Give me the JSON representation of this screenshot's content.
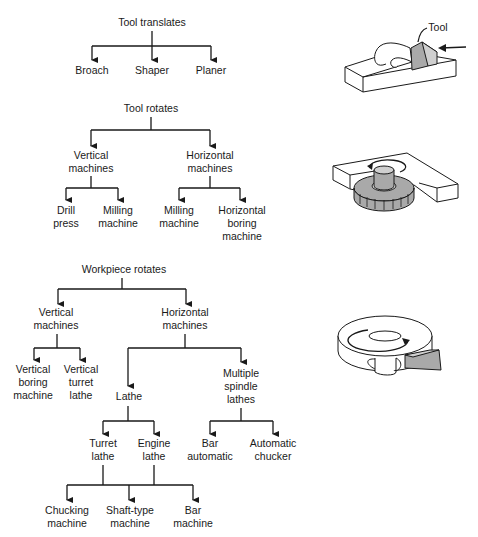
{
  "trees": {
    "tool_translates": {
      "root": "Tool translates",
      "children": [
        "Broach",
        "Shaper",
        "Planer"
      ]
    },
    "tool_rotates": {
      "root": "Tool rotates",
      "vertical": {
        "label": [
          "Vertical",
          "machines"
        ],
        "children": [
          [
            "Drill",
            "press"
          ],
          [
            "Milling",
            "machine"
          ]
        ]
      },
      "horizontal": {
        "label": [
          "Horizontal",
          "machines"
        ],
        "children": [
          [
            "Milling",
            "machine"
          ],
          [
            "Horizontal",
            "boring",
            "machine"
          ]
        ]
      }
    },
    "workpiece_rotates": {
      "root": "Workpiece rotates",
      "vertical": {
        "label": [
          "Vertical",
          "machines"
        ],
        "children": [
          [
            "Vertical",
            "boring",
            "machine"
          ],
          [
            "Vertical",
            "turret",
            "lathe"
          ]
        ]
      },
      "horizontal": {
        "label": [
          "Horizontal",
          "machines"
        ],
        "lathe": {
          "label": "Lathe",
          "children": [
            [
              "Turret",
              "lathe"
            ],
            [
              "Engine",
              "lathe"
            ]
          ],
          "grandchildren": [
            [
              "Chucking",
              "machine"
            ],
            [
              "Shaft-type",
              "machine"
            ],
            [
              "Bar",
              "machine"
            ]
          ]
        },
        "multiple_spindle": {
          "label": [
            "Multiple",
            "spindle",
            "lathes"
          ],
          "children": [
            [
              "Bar",
              "automatic"
            ],
            [
              "Automatic",
              "chucker"
            ]
          ]
        }
      }
    }
  },
  "illustrations": {
    "translating_tool": {
      "callout": "Tool"
    }
  },
  "colors": {
    "ink": "#1a1a1a",
    "tool_gray": "#a9a9a9",
    "background": "#ffffff"
  }
}
